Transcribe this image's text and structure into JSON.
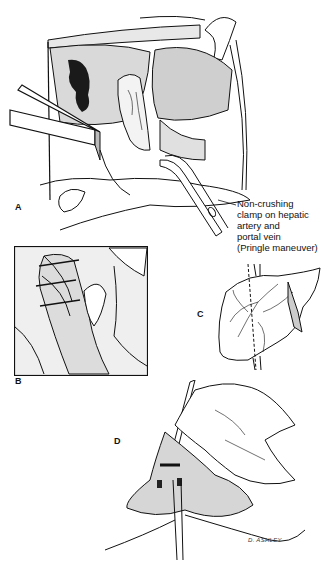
{
  "figure": {
    "panels": [
      {
        "id": "A",
        "label": "A"
      },
      {
        "id": "B",
        "label": "B"
      },
      {
        "id": "C",
        "label": "C"
      },
      {
        "id": "D",
        "label": "D"
      }
    ],
    "callout": {
      "text": "Non-crushing\nclamp on hepatic\nartery and\nportal vein\n(Pringle maneuver)"
    },
    "signature": "D. ASHLEY",
    "colors": {
      "ink": "#111111",
      "paper": "#ffffff",
      "stipple": "#555555"
    }
  }
}
